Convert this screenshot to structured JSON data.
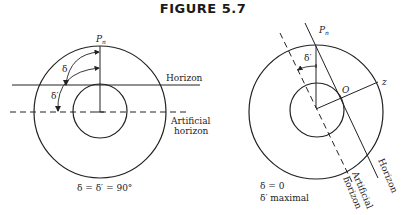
{
  "figure": {
    "title": "FIGURE 5.7",
    "left": {
      "pole_label": "P",
      "pole_sub": "n",
      "delta": "δ",
      "delta_prime": "δ′",
      "horizon": "Horizon",
      "artificial_1": "Artificial",
      "artificial_2": "horizon",
      "caption": "δ = δ′ = 90°"
    },
    "right": {
      "pole_label": "P",
      "pole_sub": "n",
      "delta_prime": "δ′",
      "observer": "O",
      "zenith": "z",
      "horizon": "Horizon",
      "artificial_1": "Artificial",
      "artificial_2": "horizon",
      "caption_1": "δ = 0",
      "caption_2": "δ′ maximal"
    },
    "colors": {
      "ink": "#222222",
      "background": "#ffffff"
    }
  }
}
